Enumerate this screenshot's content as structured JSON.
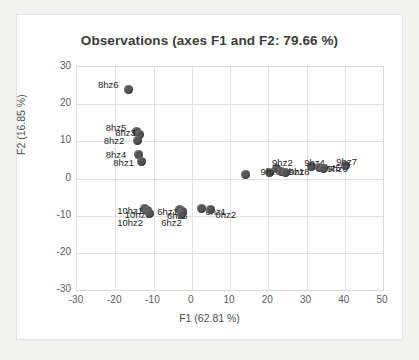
{
  "chart_data": {
    "type": "scatter",
    "title": "Observations (axes F1 and F2: 79.66 %)",
    "xlabel": "F1 (62.81 %)",
    "ylabel": "F2 (16.85 %)",
    "xlim": [
      -30,
      50
    ],
    "ylim": [
      -30,
      30
    ],
    "xticks": [
      "-30",
      "-20",
      "-10",
      "0",
      "10",
      "20",
      "30",
      "40",
      "50"
    ],
    "yticks": [
      "30",
      "20",
      "10",
      "0",
      "-10",
      "-20",
      "-30"
    ],
    "grid": true,
    "legend": "none",
    "marker_color": "#555555",
    "points": [
      {
        "label": "8hz6",
        "x": -16.5,
        "y": 24.0,
        "lx": -24.5,
        "ly": 26.5
      },
      {
        "label": "8hz5",
        "x": -14.5,
        "y": 12.6,
        "lx": -22.5,
        "ly": 15.0
      },
      {
        "label": "8hz3",
        "x": -13.6,
        "y": 11.8,
        "lx": -20.0,
        "ly": 13.6
      },
      {
        "label": "8hz2",
        "x": -14.2,
        "y": 10.2,
        "lx": -23.0,
        "ly": 11.4
      },
      {
        "label": "8hz4",
        "x": -13.8,
        "y": 6.4,
        "lx": -22.5,
        "ly": 7.8
      },
      {
        "label": "8hz1",
        "x": -13.2,
        "y": 4.6,
        "lx": -20.5,
        "ly": 5.4
      },
      {
        "label": "10hz1",
        "x": -12.4,
        "y": -8.2,
        "lx": -19.5,
        "ly": -7.4
      },
      {
        "label": "10hz3",
        "x": -11.6,
        "y": -8.6,
        "lx": -17.5,
        "ly": -8.6
      },
      {
        "label": "10hz2",
        "x": -11.0,
        "y": -9.4,
        "lx": -19.5,
        "ly": -10.6
      },
      {
        "label": "6hz1",
        "x": -3.2,
        "y": -8.4,
        "lx": -9.0,
        "ly": -7.6
      },
      {
        "label": "6hz3",
        "x": -2.3,
        "y": -8.8,
        "lx": -6.5,
        "ly": -8.8
      },
      {
        "label": "6hz2",
        "x": -2.8,
        "y": -9.6,
        "lx": -8.0,
        "ly": -10.6
      },
      {
        "label": "0hz1",
        "x": 2.6,
        "y": -8.0,
        "lx": 3.6,
        "ly": -7.6
      },
      {
        "label": "0hz2",
        "x": 5.0,
        "y": -8.4,
        "lx": 6.2,
        "ly": -8.4
      },
      {
        "label": "",
        "x": 14.0,
        "y": 1.0,
        "lx": null,
        "ly": null
      },
      {
        "label": "9hz3",
        "x": 20.2,
        "y": 1.6,
        "lx": 18.0,
        "ly": 3.0
      },
      {
        "label": "9hz2",
        "x": 22.2,
        "y": 2.8,
        "lx": 21.0,
        "ly": 5.4
      },
      {
        "label": "9hz1",
        "x": 23.4,
        "y": 1.8,
        "lx": 24.0,
        "ly": 3.0
      },
      {
        "label": "9hz8",
        "x": 24.6,
        "y": 1.6,
        "lx": 25.4,
        "ly": 3.0
      },
      {
        "label": "9hz4",
        "x": 31.2,
        "y": 3.2,
        "lx": 29.4,
        "ly": 5.4
      },
      {
        "label": "9hz5",
        "x": 33.4,
        "y": 3.0,
        "lx": 33.6,
        "ly": 4.2
      },
      {
        "label": "9hz6",
        "x": 34.4,
        "y": 2.8,
        "lx": 35.4,
        "ly": 4.0
      },
      {
        "label": "9hz7",
        "x": 40.2,
        "y": 3.4,
        "lx": 37.8,
        "ly": 5.8
      }
    ]
  }
}
